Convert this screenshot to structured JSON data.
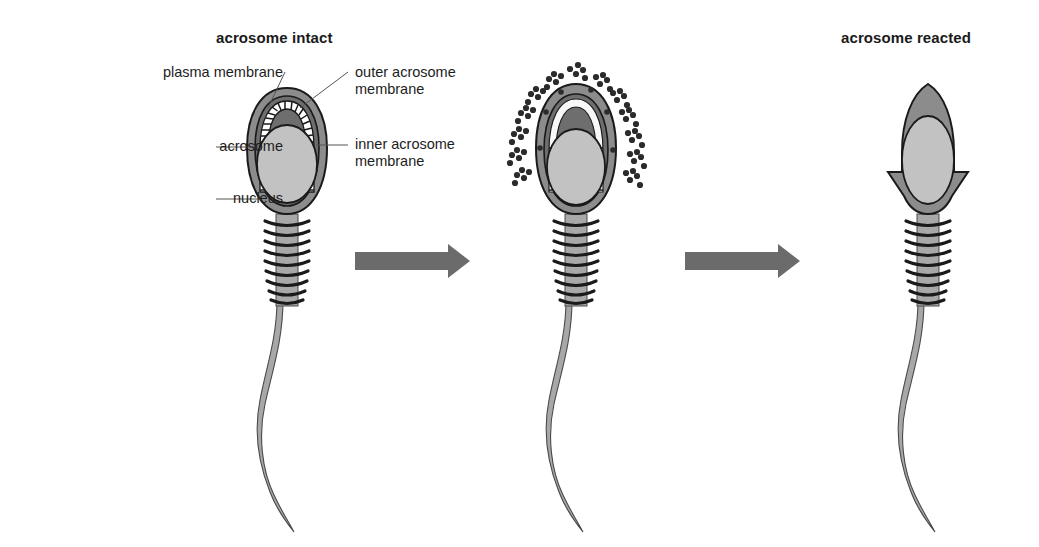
{
  "figure": {
    "caption_left": "acrosome intact",
    "caption_right": "acrosome reacted",
    "labels": {
      "plasma_membrane": "plasma membrane",
      "acrosome": "acrosome",
      "nucleus": "nucleus",
      "outer_acrosome_membrane": "outer acrosome\nmembrane",
      "outer_acrosome_membrane_line1": "outer acrosome",
      "outer_acrosome_membrane_line2": "membrane",
      "inner_acrosome_membrane_line1": "inner acrosome",
      "inner_acrosome_membrane_line2": "membrane"
    },
    "colors": {
      "outline": "#1a1a1a",
      "plasma_membrane_fill": "#8c8c8c",
      "acrosome_fill": "#6e6e6e",
      "nucleus_fill": "#c2c2c2",
      "tail_fill": "#a8a8a8",
      "arrow_fill": "#6b6b6b",
      "vesicle_fill": "#2b2b2b",
      "leader_line": "#555555",
      "background": "#ffffff",
      "text": "#1d1d1d"
    },
    "cells": [
      {
        "name": "sperm-intact",
        "stage": "acrosome intact",
        "description": "Sperm head with plasma membrane, intact acrosome with outer and inner acrosome membranes, and nucleus; midpiece with mitochondrial sheath bands and a long S-curved flagellum.",
        "midpiece_bands": 9
      },
      {
        "name": "sperm-reacting",
        "stage": "acrosome reaction in progress",
        "description": "Membrane vesiculation: plasma membrane and outer acrosome membrane fuse and bleb off as vesicles releasing acrosomal contents.",
        "midpiece_bands": 9,
        "vesicle_clusters": 14
      },
      {
        "name": "sperm-reacted",
        "stage": "acrosome reacted",
        "description": "Acrosomal cap shed, exposing the inner acrosome membrane over the pointed nucleus with flared equatorial remnant.",
        "midpiece_bands": 9
      }
    ],
    "arrows": [
      {
        "name": "arrow-1",
        "from": "sperm-intact",
        "to": "sperm-reacting"
      },
      {
        "name": "arrow-2",
        "from": "sperm-reacting",
        "to": "sperm-reacted"
      }
    ]
  }
}
